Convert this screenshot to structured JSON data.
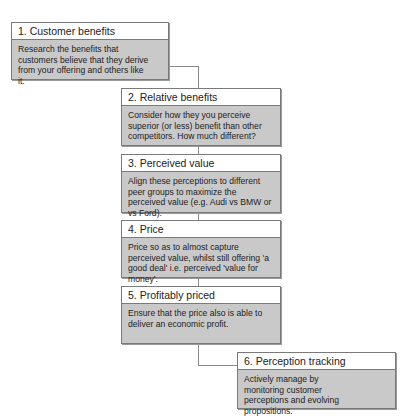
{
  "diagram": {
    "type": "process-flow",
    "steps": [
      {
        "title": "1. Customer benefits",
        "text": "Research the benefits that customers believe that they derive from your offering and others like it."
      },
      {
        "title": "2. Relative benefits",
        "text": "Consider how they you perceive superior (or less) benefit than other competitors. How much different?"
      },
      {
        "title": "3. Perceived value",
        "text": "Align these perceptions to different peer groups to maximize the perceived value (e.g. Audi vs BMW or vs Ford)."
      },
      {
        "title": "4. Price",
        "text": "Price so as to almost capture perceived value, whilst still offering 'a good deal' i.e. perceived 'value for money'."
      },
      {
        "title": "5. Profitably priced",
        "text": "Ensure that the price also is able to deliver an economic profit."
      },
      {
        "title": "6. Perception tracking",
        "text": "Actively manage by monitoring customer perceptions and evolving propositions."
      }
    ],
    "colors": {
      "header_bg": "#ffffff",
      "body_bg": "#c9c9c9",
      "border": "#7a7a7a",
      "connector": "#8a8a8a"
    }
  }
}
